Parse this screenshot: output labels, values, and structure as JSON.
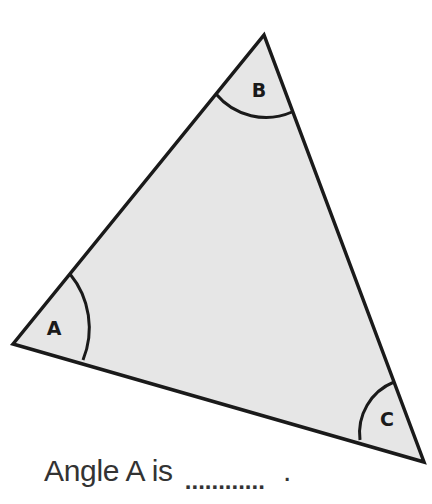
{
  "diagram": {
    "type": "triangle",
    "fill_color": "#e6e6e6",
    "stroke_color": "#1a1a1a",
    "vertices": [
      {
        "name": "A",
        "label": "A",
        "x": 13,
        "y": 344
      },
      {
        "name": "B",
        "label": "B",
        "x": 264,
        "y": 35
      },
      {
        "name": "C",
        "label": "C",
        "x": 424,
        "y": 462
      }
    ]
  },
  "question": {
    "prefix": "Angle A is",
    "blank": "............",
    "suffix": "."
  }
}
